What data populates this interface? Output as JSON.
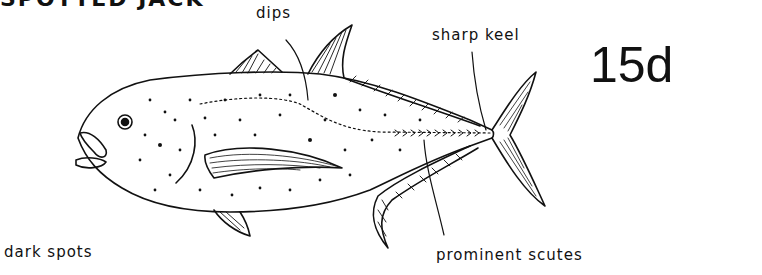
{
  "title": "SPOTTED JACK",
  "plate_number": "15d",
  "labels": {
    "dips": "dips",
    "sharp_keel": "sharp keel",
    "dark_spots": "dark spots",
    "prominent_scutes": "prominent scutes"
  },
  "colors": {
    "ink": "#111111",
    "background": "#ffffff"
  }
}
